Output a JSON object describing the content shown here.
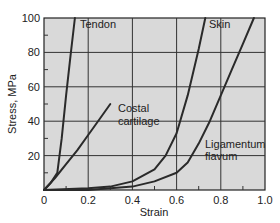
{
  "chart_data": {
    "type": "line",
    "title": "",
    "xlabel": "Strain",
    "ylabel": "Stress, MPa",
    "xlim": [
      0,
      1.0
    ],
    "ylim": [
      0,
      100
    ],
    "xticks": [
      0,
      0.2,
      0.4,
      0.6,
      0.8,
      1.0
    ],
    "xtick_labels": [
      "0",
      "0.2",
      "0.4",
      "0.6",
      "0.8",
      "1.0"
    ],
    "yticks": [
      20,
      40,
      60,
      80,
      100
    ],
    "ytick_labels": [
      "20",
      "40",
      "60",
      "80",
      "100"
    ],
    "grid": true,
    "background": "#d9d9d9",
    "line_color": "#2a2a2a",
    "legend": "inline labels",
    "series": [
      {
        "name": "Tendon",
        "label_lines": [
          "Tendon"
        ],
        "x": [
          0,
          0.03,
          0.06,
          0.08,
          0.1,
          0.12,
          0.14
        ],
        "y": [
          0,
          4,
          10,
          30,
          55,
          78,
          100
        ]
      },
      {
        "name": "Costal cartilage",
        "label_lines": [
          "Costal",
          "cartilage"
        ],
        "x": [
          0,
          0.05,
          0.1,
          0.15,
          0.2,
          0.25,
          0.3
        ],
        "y": [
          0,
          7,
          15,
          23,
          32,
          41,
          50
        ]
      },
      {
        "name": "Skin",
        "label_lines": [
          "Skin"
        ],
        "x": [
          0,
          0.2,
          0.3,
          0.4,
          0.5,
          0.55,
          0.6,
          0.65,
          0.7,
          0.73
        ],
        "y": [
          0,
          1,
          2,
          5,
          12,
          20,
          33,
          55,
          82,
          100
        ]
      },
      {
        "name": "Ligamentum flavum",
        "label_lines": [
          "Ligamentum",
          "flavum"
        ],
        "x": [
          0,
          0.2,
          0.4,
          0.5,
          0.6,
          0.65,
          0.7,
          0.75,
          0.8,
          0.85,
          0.9,
          0.95
        ],
        "y": [
          0,
          0,
          2,
          5,
          10,
          16,
          27,
          40,
          55,
          70,
          85,
          100
        ]
      }
    ]
  }
}
